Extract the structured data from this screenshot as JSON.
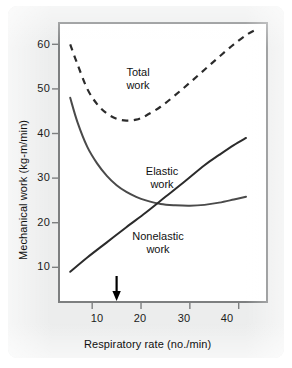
{
  "figure": {
    "background_color": "#eceded",
    "plot_background": "#ffffff",
    "frame_color": "#7d7f80"
  },
  "chart_data": {
    "type": "line",
    "title": "",
    "xlabel": "Respiratory rate (no./min)",
    "ylabel": "Mechanical work (kg-m/min)",
    "xlim": [
      3,
      46
    ],
    "ylim": [
      2,
      65
    ],
    "xticks": [
      10,
      20,
      30,
      40
    ],
    "yticks": [
      10,
      20,
      30,
      40,
      50,
      60
    ],
    "xtick_labels": [
      "10",
      "20",
      "30",
      "40"
    ],
    "ytick_labels": [
      "10",
      "20",
      "30",
      "40",
      "50",
      "60"
    ],
    "grid": false,
    "legend": "inline-labels",
    "series": [
      {
        "name": "Total work",
        "style": "dashed",
        "color": "#2b2b2b",
        "x": [
          5.5,
          7,
          9,
          11,
          13,
          15,
          17,
          19,
          21,
          24,
          27,
          30,
          33,
          36,
          39,
          42,
          44
        ],
        "y": [
          60.0,
          55.5,
          50.0,
          46.6,
          44.5,
          43.3,
          42.9,
          43.1,
          44.0,
          46.0,
          48.6,
          51.4,
          54.3,
          57.2,
          60.0,
          62.4,
          63.5
        ]
      },
      {
        "name": "Elastic work",
        "style": "solid",
        "color": "#4a4a4a",
        "x": [
          5.5,
          7,
          9,
          11,
          13,
          15,
          17,
          19,
          21,
          24,
          27,
          30,
          33,
          36,
          39,
          41.5
        ],
        "y": [
          48.0,
          42.5,
          37.0,
          33.3,
          30.5,
          28.4,
          26.9,
          25.8,
          25.0,
          24.2,
          23.9,
          23.8,
          24.0,
          24.5,
          25.2,
          25.8
        ]
      },
      {
        "name": "Nonelastic work",
        "style": "solid",
        "color": "#2b2b2b",
        "x": [
          5.5,
          9,
          13,
          17,
          21,
          25,
          29,
          33,
          36,
          39,
          41.5
        ],
        "y": [
          9.0,
          12.2,
          15.6,
          19.0,
          22.3,
          25.8,
          29.3,
          32.9,
          35.2,
          37.4,
          39.0
        ]
      }
    ],
    "annotations": [
      {
        "name": "optimum-rate-arrow",
        "type": "down-arrow",
        "x": 15,
        "label": ""
      }
    ],
    "curve_labels": [
      {
        "text_line1": "Total",
        "text_line2": "work"
      },
      {
        "text_line1": "Elastic",
        "text_line2": "work"
      },
      {
        "text_line1": "Nonelastic",
        "text_line2": "work"
      }
    ]
  }
}
